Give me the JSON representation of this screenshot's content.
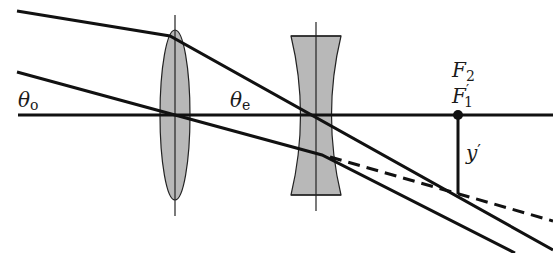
{
  "diagram": {
    "colors": {
      "line": "#111111",
      "lens_fill": "#b8b8b8",
      "background": "#ffffff"
    },
    "labels": {
      "theta_o": {
        "symbol": "θ",
        "subscript": "o"
      },
      "theta_e": {
        "symbol": "θ",
        "subscript": "e"
      },
      "f2": {
        "symbol": "F",
        "subscript": "2"
      },
      "f1_prime": {
        "symbol": "F",
        "prime": "′",
        "subscript": "1"
      },
      "y_prime": {
        "symbol": "y",
        "prime": "′"
      }
    },
    "elements": [
      {
        "name": "optical-axis",
        "type": "line"
      },
      {
        "name": "objective-convex-lens",
        "type": "converging lens"
      },
      {
        "name": "eyepiece-concave-lens",
        "type": "diverging lens"
      },
      {
        "name": "upper-ray",
        "type": "ray"
      },
      {
        "name": "lower-ray",
        "type": "ray"
      },
      {
        "name": "extended-ray",
        "type": "dashed line"
      },
      {
        "name": "focal-point",
        "type": "point"
      },
      {
        "name": "image-height",
        "type": "line"
      }
    ]
  }
}
